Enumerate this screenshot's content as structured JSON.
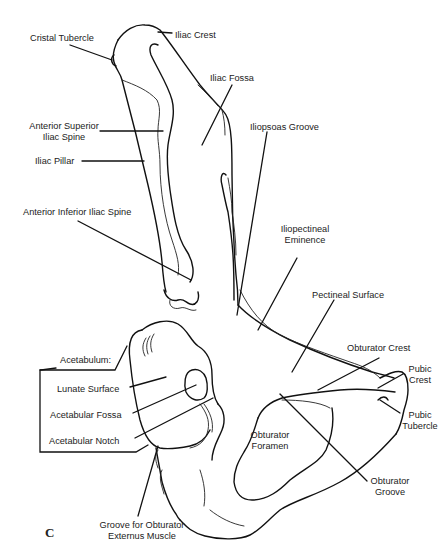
{
  "figure": {
    "panel_letter": "C",
    "line_color": "#111111",
    "text_color": "#222222",
    "background": "#ffffff"
  },
  "labels": {
    "cristal_tubercle": "Cristal Tubercle",
    "iliac_crest": "Iliac Crest",
    "iliac_fossa": "Iliac Fossa",
    "asis_line1": "Anterior Superior",
    "asis_line2": "Iliac Spine",
    "iliac_pillar": "Iliac Pillar",
    "iliopsoas_groove": "Iliopsoas Groove",
    "aiis": "Anterior Inferior Iliac Spine",
    "iliopectineal_line1": "Iliopectineal",
    "iliopectineal_line2": "Eminence",
    "pectineal_surface": "Pectineal Surface",
    "obturator_crest": "Obturator Crest",
    "acetabulum": "Acetabulum:",
    "lunate_surface": "Lunate Surface",
    "acetabular_fossa": "Acetabular Fossa",
    "acetabular_notch": "Acetabular Notch",
    "pubic_crest_line1": "Pubic",
    "pubic_crest_line2": "Crest",
    "pubic_tubercle_line1": "Pubic",
    "pubic_tubercle_line2": "Tubercle",
    "obturator_foramen_line1": "Obturator",
    "obturator_foramen_line2": "Foramen",
    "obturator_groove_line1": "Obturator",
    "obturator_groove_line2": "Groove",
    "groove_obturator_externus_line1": "Groove for Obturator",
    "groove_obturator_externus_line2": "Externus Muscle"
  }
}
